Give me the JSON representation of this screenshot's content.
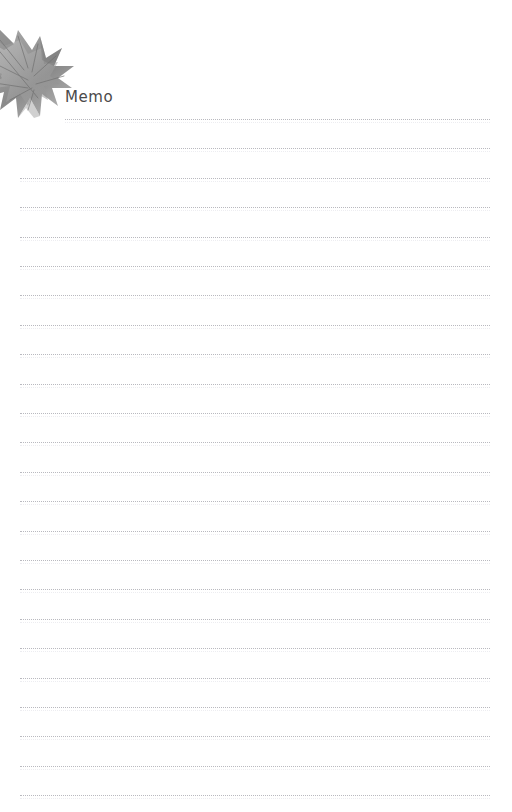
{
  "page": {
    "title": "Memo",
    "background_color": "#ffffff",
    "width": 512,
    "height": 812
  },
  "header": {
    "memo_label": "Memo",
    "memo_label_color": "#4a4a4a"
  },
  "decoration": {
    "leaf_icon_name": "maple-leaf-icon",
    "leaf_colors": {
      "light": "#cfcfcf",
      "mid": "#a8a8a8",
      "dark": "#777777",
      "darkest": "#5e5e5e"
    }
  },
  "note_lines": {
    "count": 24,
    "color": "#b9b9bf",
    "style": "dotted",
    "left_margin": 20,
    "right_margin": 490,
    "first_line_left": 65,
    "first_line_top": 119,
    "spacing": 29.4
  }
}
